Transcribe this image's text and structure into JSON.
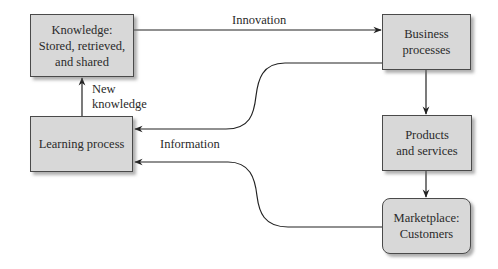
{
  "diagram": {
    "nodes": {
      "knowledge": {
        "label": "Knowledge:\nStored, retrieved,\nand shared"
      },
      "business": {
        "label": "Business\nprocesses"
      },
      "learning": {
        "label": "Learning process"
      },
      "products": {
        "label": "Products\nand services"
      },
      "marketplace": {
        "label": "Marketplace:\nCustomers"
      }
    },
    "edges": {
      "innovation": {
        "label": "Innovation",
        "from": "knowledge",
        "to": "business"
      },
      "new_knowledge": {
        "label": "New\nknowledge",
        "from": "learning",
        "to": "knowledge"
      },
      "business_to_learning": {
        "label": "",
        "from": "business",
        "to": "learning"
      },
      "business_to_products": {
        "label": "",
        "from": "business",
        "to": "products"
      },
      "products_to_marketplace": {
        "label": "",
        "from": "products",
        "to": "marketplace"
      },
      "information": {
        "label": "Information",
        "from": "marketplace",
        "to": "learning"
      }
    },
    "colors": {
      "box_fill": "#d8d8d8",
      "box_border": "#4a4a4a",
      "line": "#222222",
      "text": "#2a2a2a"
    }
  }
}
